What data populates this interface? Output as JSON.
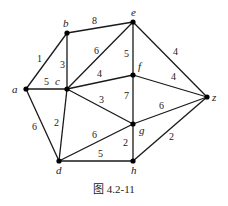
{
  "caption": "图 4.2-11",
  "graph": {
    "nodes": [
      {
        "id": "a",
        "label": "a",
        "x": 26,
        "y": 89,
        "lx": 12,
        "ly": 93
      },
      {
        "id": "b",
        "label": "b",
        "x": 67,
        "y": 33,
        "lx": 63,
        "ly": 27
      },
      {
        "id": "c",
        "label": "c",
        "x": 67,
        "y": 89,
        "lx": 55,
        "ly": 85
      },
      {
        "id": "d",
        "label": "d",
        "x": 59,
        "y": 161,
        "lx": 56,
        "ly": 174
      },
      {
        "id": "e",
        "label": "e",
        "x": 133,
        "y": 22,
        "lx": 131,
        "ly": 16
      },
      {
        "id": "f",
        "label": "f",
        "x": 133,
        "y": 75,
        "lx": 138,
        "ly": 70
      },
      {
        "id": "g",
        "label": "g",
        "x": 133,
        "y": 124,
        "lx": 139,
        "ly": 134
      },
      {
        "id": "h",
        "label": "h",
        "x": 133,
        "y": 161,
        "lx": 131,
        "ly": 174
      },
      {
        "id": "z",
        "label": "z",
        "x": 207,
        "y": 97,
        "lx": 212,
        "ly": 101
      }
    ],
    "edges": [
      {
        "from": "a",
        "to": "b",
        "weight": "1",
        "lx": 37,
        "ly": 62
      },
      {
        "from": "a",
        "to": "c",
        "weight": "5",
        "lx": 44,
        "ly": 85
      },
      {
        "from": "a",
        "to": "d",
        "weight": "6",
        "lx": 32,
        "ly": 130
      },
      {
        "from": "b",
        "to": "c",
        "weight": "3",
        "lx": 60,
        "ly": 68
      },
      {
        "from": "b",
        "to": "e",
        "weight": "8",
        "lx": 92,
        "ly": 24
      },
      {
        "from": "c",
        "to": "e",
        "weight": "6",
        "lx": 94,
        "ly": 54
      },
      {
        "from": "c",
        "to": "f",
        "weight": "4",
        "lx": 97,
        "ly": 77
      },
      {
        "from": "c",
        "to": "g",
        "weight": "3",
        "lx": 99,
        "ly": 103
      },
      {
        "from": "c",
        "to": "d",
        "weight": "2",
        "lx": 54,
        "ly": 126
      },
      {
        "from": "e",
        "to": "f",
        "weight": "5",
        "lx": 124,
        "ly": 57
      },
      {
        "from": "e",
        "to": "z",
        "weight": "4",
        "lx": 173,
        "ly": 55
      },
      {
        "from": "f",
        "to": "z",
        "weight": "4",
        "lx": 171,
        "ly": 80
      },
      {
        "from": "f",
        "to": "g",
        "weight": "7",
        "lx": 124,
        "ly": 99
      },
      {
        "from": "g",
        "to": "z",
        "weight": "6",
        "lx": 159,
        "ly": 109
      },
      {
        "from": "d",
        "to": "g",
        "weight": "6",
        "lx": 92,
        "ly": 138
      },
      {
        "from": "g",
        "to": "h",
        "weight": "2",
        "lx": 123,
        "ly": 146
      },
      {
        "from": "d",
        "to": "h",
        "weight": "5",
        "lx": 98,
        "ly": 157
      },
      {
        "from": "h",
        "to": "z",
        "weight": "2",
        "lx": 169,
        "ly": 140
      }
    ]
  }
}
